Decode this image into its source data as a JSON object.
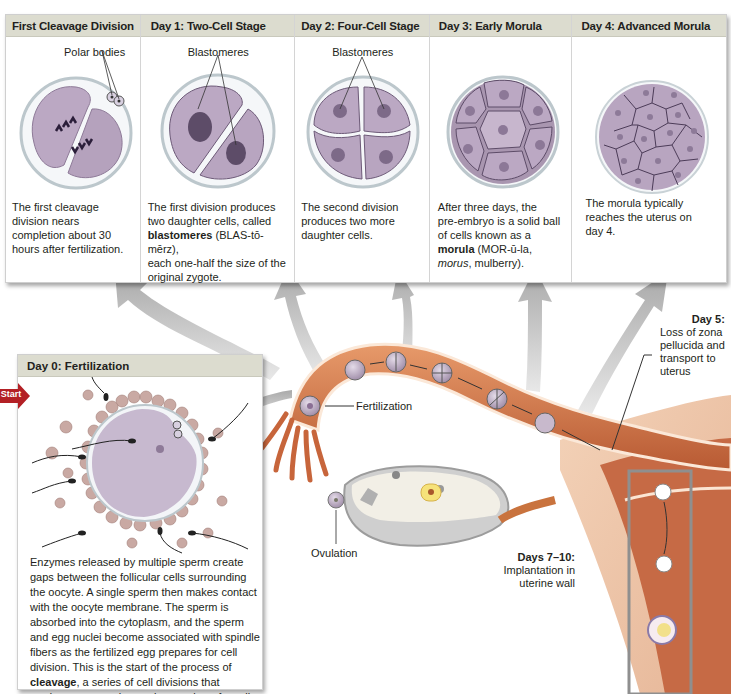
{
  "stages": [
    {
      "title": "First Cleavage Division",
      "label": "Polar bodies",
      "description": [
        "The first cleavage",
        "division nears",
        "completion about 30",
        "hours after fertilization."
      ]
    },
    {
      "title": "Day 1: Two-Cell Stage",
      "label": "Blastomeres",
      "description_parts": {
        "line1": "The first  division produces",
        "line2": "two daughter cells, called",
        "bold": "blastomeres",
        "line3_rest": " (BLAS-tō-mērz),",
        "line4": "each one-half the size of the",
        "line5": "original zygote."
      }
    },
    {
      "title": "Day 2: Four-Cell Stage",
      "label": "Blastomeres",
      "description": [
        "The second  division",
        "produces two more",
        "daughter cells."
      ]
    },
    {
      "title": "Day 3: Early Morula",
      "description_parts": {
        "line1": "After three days, the",
        "line2": "pre-embryo is a solid ball",
        "line3": "of cells known as a",
        "bold": "morula",
        "line4_rest": " (MOR-ū-la,",
        "italic": "morus",
        "line5_rest": ", mulberry)."
      }
    },
    {
      "title": "Day 4: Advanced Morula",
      "description": [
        "The morula typically",
        "reaches the uterus on",
        "day 4."
      ]
    }
  ],
  "day0": {
    "title": "Day 0: Fertilization",
    "start_label": "Start",
    "description_parts": {
      "text1": "Enzymes released by multiple sperm create gaps between the follicular cells surrounding the oocyte. A single sperm then makes contact with the oocyte membrane. The sperm is absorbed into the cytoplasm, and the sperm and egg nuclei become associated with spindle fibers as the fertilized egg prepares for cell division. This is the start of the process of ",
      "bold": "cleavage",
      "text2": ", a series of cell divisions that produces an ever-increasing number of smaller and smaller daughter cells."
    }
  },
  "annotations": {
    "fertilization": "Fertilization",
    "ovulation": "Ovulation",
    "day5_title": "Day 5:",
    "day5_lines": [
      "Loss of zona",
      "pellucida and",
      "transport to",
      "uterus"
    ],
    "days7_10_title": "Days 7–10:",
    "days7_10_lines": [
      "Implantation in",
      "uterine wall"
    ]
  },
  "colors": {
    "header_bg": "#dcdccf",
    "cell_purple": "#b9a6bf",
    "tube_orange": "#c8693f",
    "start_red": "#b32025",
    "arrow_gray": "#b8b8b8"
  }
}
